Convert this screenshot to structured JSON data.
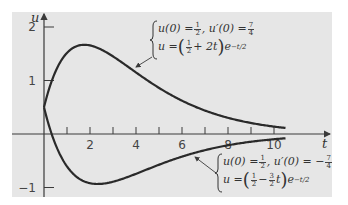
{
  "chart_data": {
    "type": "line",
    "title": "",
    "xlabel": "t",
    "ylabel": "u",
    "xlim": [
      -1.4,
      12.6
    ],
    "ylim": [
      -1.2,
      2.2
    ],
    "x_ticks": [
      1,
      2,
      3,
      4,
      5,
      6,
      7,
      8,
      9,
      10
    ],
    "x_tick_labels": [
      {
        "value": 2,
        "label": "2"
      },
      {
        "value": 4,
        "label": "4"
      },
      {
        "value": 6,
        "label": "6"
      },
      {
        "value": 8,
        "label": "8"
      },
      {
        "value": 10,
        "label": "10"
      }
    ],
    "y_tick_labels": [
      {
        "value": 2,
        "label": "2"
      },
      {
        "value": 1,
        "label": "1"
      },
      {
        "value": -1,
        "label": "−1"
      }
    ],
    "grid": false,
    "background": "#e6e6e6",
    "line_color": "#2a2a2a",
    "series": [
      {
        "name": "upper",
        "formula": "u = (1/2 + 2t) e^(-t/2)",
        "initial_conditions": "u(0) = 1/2, u'(0) = 7/4",
        "t_range": [
          0,
          10.5
        ],
        "x": [
          0,
          0.5,
          1,
          1.5,
          1.75,
          2,
          3,
          4,
          5,
          6,
          7,
          8,
          9,
          10,
          10.5
        ],
        "values": [
          0.5,
          1.17,
          1.52,
          1.65,
          1.67,
          1.66,
          1.45,
          1.15,
          0.86,
          0.62,
          0.44,
          0.31,
          0.21,
          0.14,
          0.12
        ]
      },
      {
        "name": "lower",
        "formula": "u = (1/2 - 3/2 t) e^(-t/2)",
        "initial_conditions": "u(0) = 1/2, u'(0) = -7/4",
        "t_range": [
          0,
          10.5
        ],
        "x": [
          0,
          0.5,
          1,
          1.5,
          2,
          2.33,
          3,
          4,
          5,
          6,
          7,
          8,
          9,
          10,
          10.5
        ],
        "values": [
          0.5,
          -0.19,
          -0.61,
          -0.83,
          -0.92,
          -0.93,
          -0.89,
          -0.74,
          -0.57,
          -0.42,
          -0.3,
          -0.21,
          -0.14,
          -0.1,
          -0.08
        ]
      }
    ],
    "annotations": [
      {
        "series": "upper",
        "line1": {
          "lhs": "u(0) = ",
          "frac1": [
            "1",
            "2"
          ],
          "mid": ", u′(0) = ",
          "frac2": [
            "7",
            "4"
          ]
        },
        "line2": {
          "lhs": "u = ",
          "frac": [
            "1",
            "2"
          ],
          "op": " + 2t",
          "exp": "−t/2"
        }
      },
      {
        "series": "lower",
        "line1": {
          "lhs": "u(0) = ",
          "frac1": [
            "1",
            "2"
          ],
          "mid": ", u′(0) = −",
          "frac2": [
            "7",
            "4"
          ]
        },
        "line2": {
          "lhs": "u = ",
          "frac": [
            "1",
            "2"
          ],
          "op": " − ",
          "frac_b": [
            "3",
            "2"
          ],
          "t": "t",
          "exp": "−t/2"
        }
      }
    ]
  }
}
